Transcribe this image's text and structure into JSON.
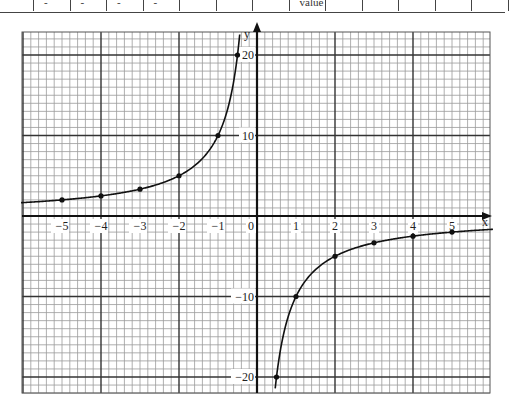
{
  "top_table_fragment": {
    "cells": [
      "-",
      "-",
      "-",
      "-",
      "",
      "",
      "",
      "value",
      "",
      "",
      "",
      "",
      "",
      ""
    ]
  },
  "chart_data": {
    "type": "line",
    "title": "",
    "function": "y = -10/x",
    "xlabel": "x",
    "ylabel": "y",
    "xlim": [
      -6,
      6
    ],
    "ylim": [
      -22,
      23
    ],
    "grid": true,
    "x_ticks": [
      -5,
      -4,
      -3,
      -2,
      -1,
      0,
      1,
      2,
      3,
      4,
      5
    ],
    "x_tick_labels": [
      "-5",
      "-4",
      "-3",
      "-2",
      "-1",
      "0",
      "1",
      "2",
      "3",
      "4",
      "5"
    ],
    "y_ticks": [
      20,
      10,
      -10,
      -20
    ],
    "y_tick_labels": [
      "20",
      "10",
      "-10",
      "-20"
    ],
    "series": [
      {
        "name": "y = -10/x (x < 0)",
        "points": [
          [
            -5,
            2
          ],
          [
            -4,
            2.5
          ],
          [
            -3,
            3.33
          ],
          [
            -2,
            5
          ],
          [
            -1,
            10
          ],
          [
            -0.5,
            20
          ]
        ]
      },
      {
        "name": "y = -10/x (x > 0)",
        "points": [
          [
            0.5,
            -20
          ],
          [
            1,
            -10
          ],
          [
            2,
            -5
          ],
          [
            3,
            -3.33
          ],
          [
            4,
            -2.5
          ],
          [
            5,
            -2
          ]
        ]
      }
    ]
  }
}
